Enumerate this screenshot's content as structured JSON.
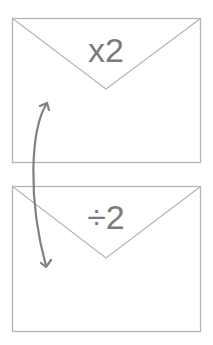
{
  "diagram": {
    "colors": {
      "outline": "#b4b4b4",
      "arrow": "#808080",
      "text": "#7a7a7a",
      "background": "#ffffff"
    },
    "envelopes": [
      {
        "id": "top",
        "label": "x2"
      },
      {
        "id": "bottom",
        "label": "÷2"
      }
    ],
    "arrow": {
      "type": "double-headed-curved",
      "connects": [
        "top",
        "bottom"
      ]
    }
  }
}
